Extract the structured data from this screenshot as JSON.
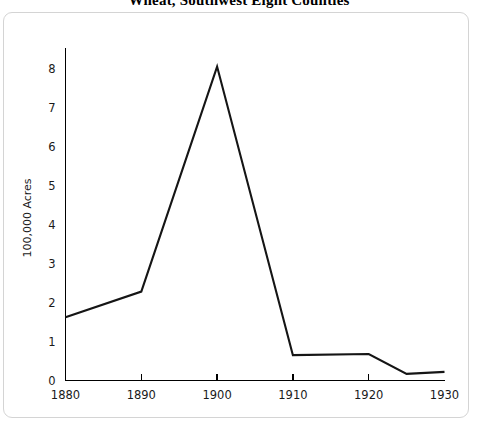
{
  "chart_data": {
    "type": "line",
    "title": "Wheat, Southwest Eight Counties",
    "xlabel": "",
    "ylabel": "100,000 Acres",
    "xlim": [
      1880,
      1930
    ],
    "ylim": [
      0,
      8.6
    ],
    "xticks": [
      "1880",
      "1890",
      "1900",
      "1910",
      "1920",
      "1930"
    ],
    "xtick_values": [
      1880,
      1890,
      1900,
      1910,
      1920,
      1930
    ],
    "yticks": [
      "0",
      "1",
      "2",
      "3",
      "4",
      "5",
      "6",
      "7",
      "8"
    ],
    "ytick_values": [
      0,
      1,
      2,
      3,
      4,
      5,
      6,
      7,
      8
    ],
    "grid": false,
    "legend": null,
    "series": [
      {
        "name": "Wheat acreage",
        "x": [
          1880,
          1890,
          1900,
          1910,
          1920,
          1925,
          1930
        ],
        "values": [
          1.62,
          2.28,
          8.05,
          0.65,
          0.68,
          0.17,
          0.22
        ],
        "color": "#151515"
      }
    ]
  },
  "frame": {
    "border_color": "#d4d4d4",
    "background": "#ffffff"
  }
}
